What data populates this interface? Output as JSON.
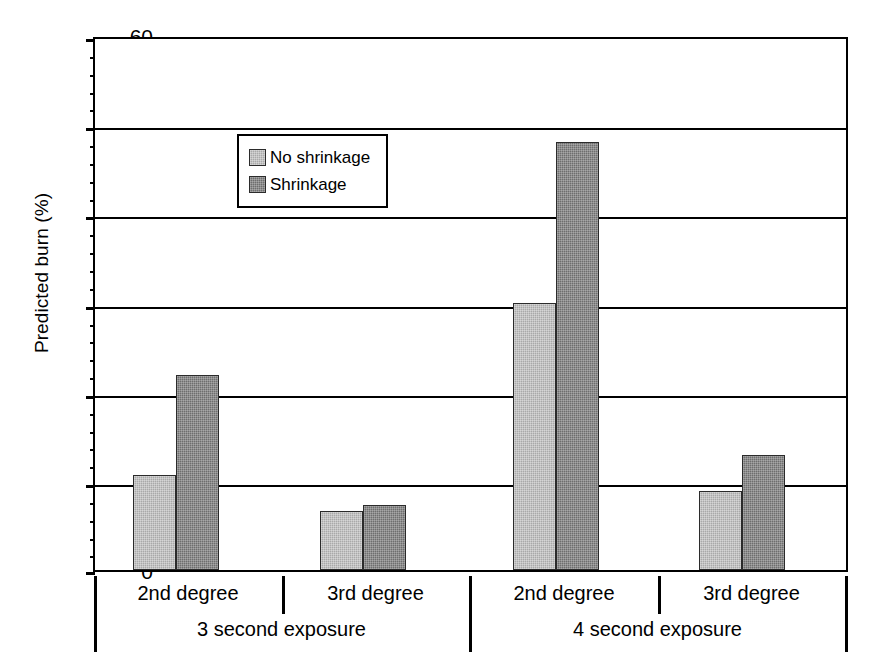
{
  "chart_data": {
    "type": "bar",
    "title": "",
    "xlabel": "",
    "ylabel": "Predicted burn (%)",
    "ylim": [
      0,
      60
    ],
    "ytick_step": 10,
    "yminor_step": 2,
    "grid": true,
    "legend_position": "upper-left-inside",
    "ytick_labels": [
      "0",
      "10",
      "20",
      "30",
      "40",
      "50",
      "60"
    ],
    "ytick_values": [
      0,
      10,
      20,
      30,
      40,
      50,
      60
    ],
    "group_labels": [
      "3 second exposure",
      "4 second exposure"
    ],
    "categories": [
      "2nd degree",
      "3rd degree",
      "2nd degree",
      "3rd degree"
    ],
    "category_groups": [
      "3 second exposure",
      "3 second exposure",
      "4 second exposure",
      "4 second exposure"
    ],
    "series": [
      {
        "name": "No shrinkage",
        "color": "#a9a9a9",
        "values": [
          10.7,
          6.6,
          30.1,
          8.9
        ]
      },
      {
        "name": "Shrinkage",
        "color": "#6e6e6e",
        "values": [
          22.0,
          7.3,
          48.2,
          13.0
        ]
      }
    ]
  },
  "legend": {
    "entries": [
      {
        "label": "No shrinkage",
        "swatch": "light-gray-swatch"
      },
      {
        "label": "Shrinkage",
        "swatch": "dark-gray-swatch"
      }
    ]
  },
  "axes": {
    "y_title": "Predicted burn (%)",
    "y_labels": [
      "60",
      "50",
      "40",
      "30",
      "20",
      "10",
      "0"
    ],
    "x_level1": [
      "2nd degree",
      "3rd degree",
      "2nd degree",
      "3rd degree"
    ],
    "x_level2": [
      "3 second exposure",
      "4 second exposure"
    ]
  }
}
